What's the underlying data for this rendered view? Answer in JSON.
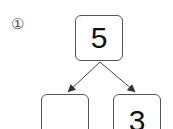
{
  "problem": {
    "number_label": "①",
    "whole": "5",
    "parts": [
      "",
      "3"
    ]
  },
  "colors": {
    "line": "#444444",
    "box_border": "#555555",
    "text": "#111111"
  }
}
